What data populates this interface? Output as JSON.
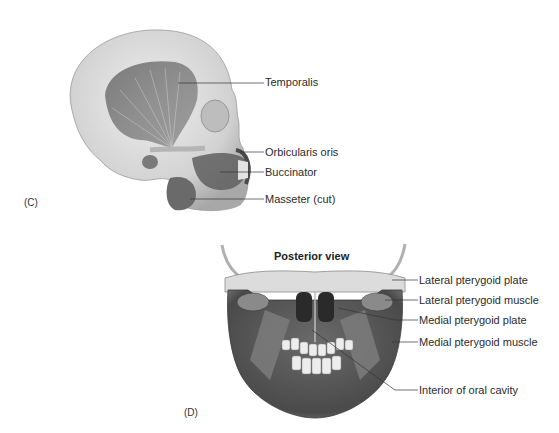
{
  "figure": {
    "panels": [
      {
        "id": "C",
        "tag": "(C)",
        "description": "Lateral view of skull showing muscles of mastication and facial muscles",
        "labels": [
          {
            "text": "Temporalis",
            "x": 265,
            "y": 76
          },
          {
            "text": "Orbicularis oris",
            "x": 265,
            "y": 146
          },
          {
            "text": "Buccinator",
            "x": 265,
            "y": 166
          },
          {
            "text": "Masseter (cut)",
            "x": 265,
            "y": 193
          }
        ]
      },
      {
        "id": "D",
        "tag": "(D)",
        "title": "Posterior view",
        "description": "Posterior view of mandible showing pterygoid muscles and oral cavity",
        "labels": [
          {
            "text": "Lateral pterygoid plate",
            "x": 419,
            "y": 274
          },
          {
            "text": "Lateral pterygoid muscle",
            "x": 419,
            "y": 296
          },
          {
            "text": "Medial pterygoid plate",
            "x": 419,
            "y": 316
          },
          {
            "text": "Medial pterygoid muscle",
            "x": 419,
            "y": 337
          },
          {
            "text": "Interior of oral cavity",
            "x": 419,
            "y": 384
          }
        ]
      }
    ]
  }
}
